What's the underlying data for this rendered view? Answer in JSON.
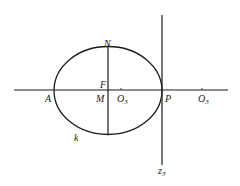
{
  "diagram": {
    "labels": {
      "N": "N",
      "F": "F",
      "M": "M",
      "A": "A",
      "P": "P",
      "O3_inner": "O",
      "O3_inner_sub": "3",
      "O3_outer": "O",
      "O3_outer_sub": "3",
      "k": "k",
      "z3": "z",
      "z3_sub": "3"
    },
    "colors": {
      "stroke": "#1a1a1a",
      "background": "#ffffff"
    }
  }
}
